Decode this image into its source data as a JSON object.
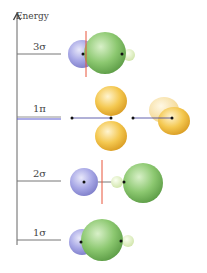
{
  "axis": {
    "label": "Energy"
  },
  "levels": [
    {
      "id": "3sigma",
      "label": "3σ",
      "degenerate": false
    },
    {
      "id": "1pi",
      "label": "1π",
      "degenerate": true
    },
    {
      "id": "2sigma",
      "label": "2σ",
      "degenerate": false
    },
    {
      "id": "1sigma",
      "label": "1σ",
      "degenerate": false
    }
  ],
  "colors": {
    "axis": "#666666",
    "level_line": "#777777",
    "pi_level_line": "#5a5ad0",
    "nodal_plane": "#e8553a",
    "blue_orbital": "#9c9ce0",
    "green_orbital": "#7cc060",
    "pale_orbital": "#dcecb8",
    "pi_orbital": "#f0c040",
    "nucleus": "#111111",
    "bond_line": "#3a3a9a"
  }
}
